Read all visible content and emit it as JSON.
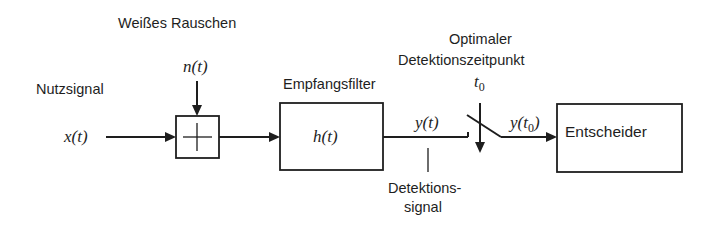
{
  "diagram": {
    "type": "block-diagram",
    "labels": {
      "noise_title": "Weißes Rauschen",
      "noise_symbol": "n(t)",
      "input_title": "Nutzsignal",
      "input_symbol": "x(t)",
      "filter_title": "Empfangsfilter",
      "filter_symbol": "h(t)",
      "output_symbol": "y(t)",
      "detection_signal_line1": "Detektions-",
      "detection_signal_line2": "signal",
      "sample_time_line1": "Optimaler",
      "sample_time_line2": "Detektionszeitpunkt",
      "sample_time_symbol_base": "t",
      "sample_time_symbol_sub": "0",
      "sampled_symbol_prefix": "y(t",
      "sampled_symbol_sub": "0",
      "sampled_symbol_suffix": ")",
      "decider_label": "Entscheider"
    },
    "nodes": [
      {
        "id": "adder",
        "label": "+"
      },
      {
        "id": "filter",
        "label": "h(t)"
      },
      {
        "id": "sampler",
        "label": "t0"
      },
      {
        "id": "decider",
        "label": "Entscheider"
      }
    ],
    "edges": [
      {
        "from": "input",
        "to": "adder",
        "label": "x(t)"
      },
      {
        "from": "noise",
        "to": "adder",
        "label": "n(t)"
      },
      {
        "from": "adder",
        "to": "filter"
      },
      {
        "from": "filter",
        "to": "sampler",
        "label": "y(t)"
      },
      {
        "from": "sampler",
        "to": "decider",
        "label": "y(t0)"
      }
    ]
  }
}
